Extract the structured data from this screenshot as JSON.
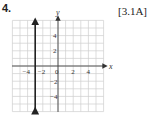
{
  "problem": {
    "number": "4.",
    "reference": "[3.1A]"
  },
  "chart_data": {
    "type": "line",
    "title": "",
    "xlabel": "x",
    "ylabel": "y",
    "xlim": [
      -6,
      6
    ],
    "ylim": [
      -6,
      6
    ],
    "grid": true,
    "x_ticks": [
      "-4",
      "-2",
      "0",
      "2",
      "4"
    ],
    "y_ticks": [
      "4",
      "2",
      "-2",
      "-4"
    ],
    "series": [
      {
        "name": "x = -3",
        "equation": "x = -3",
        "x": [
          -3,
          -3
        ],
        "y": [
          -6,
          6
        ]
      }
    ]
  }
}
